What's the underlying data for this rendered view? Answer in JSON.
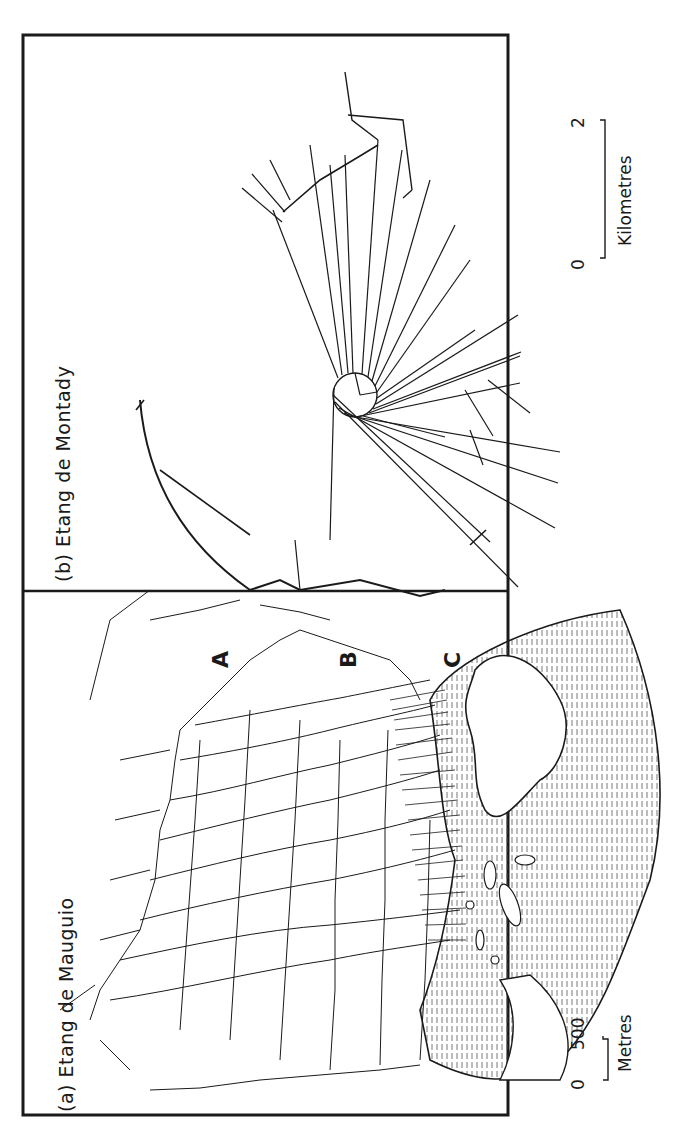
{
  "figure": {
    "orientation": "rotated 90 degrees counterclockwise",
    "panels": [
      {
        "id": "a",
        "label": "(a)",
        "title": "Etang de Mauguio",
        "zone_labels": [
          "A",
          "B",
          "C"
        ],
        "scale": {
          "start": "0",
          "end": "500",
          "unit": "Metres"
        }
      },
      {
        "id": "b",
        "label": "(b)",
        "title": "Etang de Montady",
        "scale": {
          "start": "0",
          "end": "2",
          "unit": "Kilometres"
        }
      }
    ]
  },
  "colors": {
    "ink": "#1a1a1a",
    "paper": "#ffffff",
    "marsh_hatch": "#444444"
  }
}
